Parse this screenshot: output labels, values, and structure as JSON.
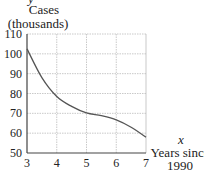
{
  "chart_data": {
    "type": "line",
    "title": "",
    "ylabel_var": "y",
    "ylabel_line1": "Cases",
    "ylabel_line2": "(thousands)",
    "xlabel_var": "x",
    "xlabel_line1": "Years since",
    "xlabel_line2": "1990",
    "xlim": [
      3,
      7
    ],
    "ylim": [
      50,
      110
    ],
    "x_ticks": [
      "3",
      "4",
      "5",
      "6",
      "7"
    ],
    "y_ticks": [
      "110",
      "100",
      "90",
      "80",
      "70",
      "60",
      "50"
    ],
    "grid": true,
    "x": [
      3,
      3.5,
      4,
      4.5,
      5,
      5.5,
      6,
      6.5,
      7
    ],
    "series": [
      {
        "name": "Cases",
        "values": [
          102.5,
          88,
          78.5,
          73.5,
          70.2,
          68.8,
          66.7,
          63,
          58
        ]
      }
    ],
    "colors": {
      "curve": "#555555",
      "axis": "#444444",
      "grid": "#bbbbbb"
    }
  }
}
